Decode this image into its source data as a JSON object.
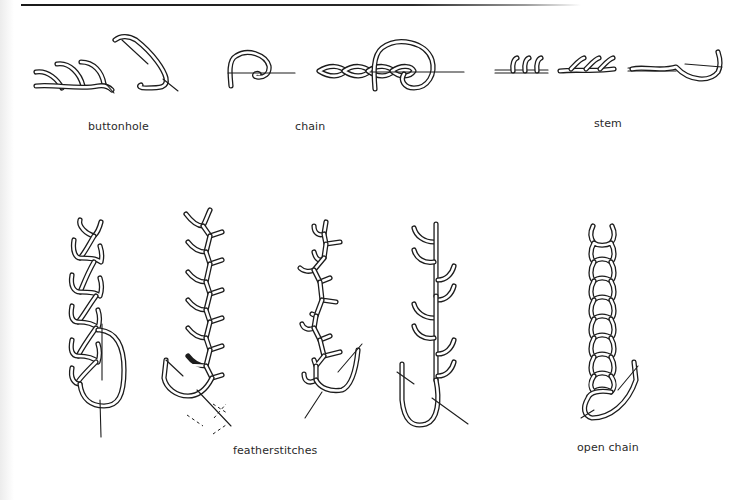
{
  "figures": [
    {
      "id": "buttonhole",
      "caption": "buttonhole"
    },
    {
      "id": "chain",
      "caption": "chain"
    },
    {
      "id": "stem",
      "caption": "stem"
    },
    {
      "id": "featherstitches",
      "caption": "featherstitches"
    },
    {
      "id": "open-chain",
      "caption": "open chain"
    }
  ],
  "colors": {
    "ink": "#1c1c1c",
    "paper": "#ffffff"
  }
}
